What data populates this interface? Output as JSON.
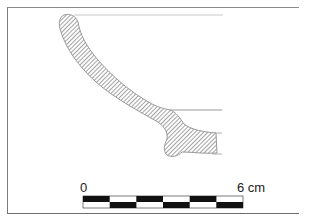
{
  "figure": {
    "type": "archaeological pottery profile drawing",
    "hatch_color": "#9a9a9a",
    "outline_color": "#8a8a8a",
    "frame_color": "#7a7a7a"
  },
  "scale_bar": {
    "start_label": "0",
    "end_label": "6 cm",
    "segments": 6,
    "colors": {
      "dark": "#111111",
      "light": "#ffffff"
    }
  }
}
